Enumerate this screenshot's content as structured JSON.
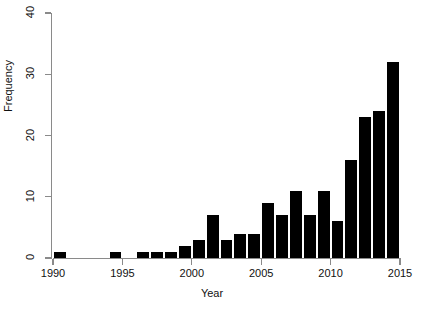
{
  "chart_data": {
    "type": "bar",
    "title": "",
    "subtitle": "",
    "xlabel": "Year",
    "ylabel": "Frequency",
    "categories": [
      1990,
      1991,
      1992,
      1993,
      1994,
      1995,
      1996,
      1997,
      1998,
      1999,
      2000,
      2001,
      2002,
      2003,
      2004,
      2005,
      2006,
      2007,
      2008,
      2009,
      2010,
      2011,
      2012,
      2013,
      2014
    ],
    "values": [
      1,
      0,
      0,
      0,
      1,
      0,
      1,
      1,
      1,
      2,
      3,
      7,
      3,
      4,
      4,
      9,
      7,
      11,
      7,
      11,
      6,
      16,
      23,
      24,
      32
    ],
    "series": [
      {
        "name": "Frequency",
        "values": [
          1,
          0,
          0,
          0,
          1,
          0,
          1,
          1,
          1,
          2,
          3,
          7,
          3,
          4,
          4,
          9,
          7,
          11,
          7,
          11,
          6,
          16,
          23,
          24,
          32
        ]
      }
    ],
    "xlim": [
      1990,
      2015
    ],
    "ylim": [
      0,
      40
    ],
    "x_ticks": [
      1990,
      1995,
      2000,
      2005,
      2010,
      2015
    ],
    "x_tick_labels": [
      "1990",
      "1995",
      "2000",
      "2005",
      "2010",
      "2015"
    ],
    "y_ticks": [
      0,
      10,
      20,
      30,
      40
    ],
    "y_tick_labels": [
      "0",
      "10",
      "20",
      "30",
      "40"
    ],
    "bin_width": 1,
    "grid": false,
    "legend": false,
    "legend_position": "none",
    "bar_color": "#000000",
    "axis_color": "#8a8a8a",
    "background_color": "#ffffff",
    "annotations": []
  }
}
